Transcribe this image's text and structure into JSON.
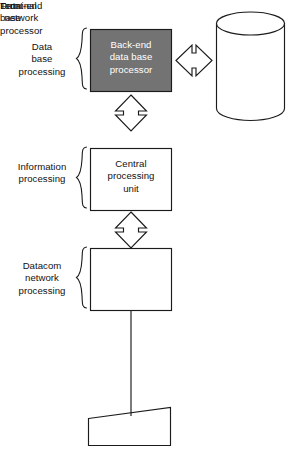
{
  "diagram": {
    "background_color": "#ffffff",
    "line_color": "#1b1b1b",
    "shaded_fill_color": "#737373",
    "shaded_text_color": "#ffffff",
    "group_labels": [
      {
        "id": "data-base-processing",
        "text": "Data\nbase\nprocessing"
      },
      {
        "id": "information-processing",
        "text": "Information\nprocessing"
      },
      {
        "id": "datacom-network-processing",
        "text": "Datacom\nnetwork\nprocessing"
      }
    ],
    "nodes": [
      {
        "id": "back-end-data-base-processor",
        "text": "Back-end\ndata base\nprocessor",
        "shape": "rectangle",
        "shaded": true
      },
      {
        "id": "data-base",
        "text": "Data\nbase",
        "shape": "cylinder",
        "shaded": false
      },
      {
        "id": "central-processing-unit",
        "text": "Central\nprocessing\nunit",
        "shape": "rectangle",
        "shaded": false
      },
      {
        "id": "front-end-network-processor",
        "text": "Front-end\nnetwork\nprocessor",
        "shape": "rectangle",
        "shaded": false
      },
      {
        "id": "terminal",
        "text": "Terminal",
        "shape": "trapezoid",
        "shaded": false
      }
    ],
    "connectors": [
      {
        "id": "backend-to-database",
        "from": "back-end-data-base-processor",
        "to": "data-base",
        "style": "double-headed-hollow-arrow",
        "orientation": "horizontal"
      },
      {
        "id": "cpu-to-backend",
        "from": "central-processing-unit",
        "to": "back-end-data-base-processor",
        "style": "double-headed-hollow-arrow",
        "orientation": "vertical"
      },
      {
        "id": "frontend-to-cpu",
        "from": "front-end-network-processor",
        "to": "central-processing-unit",
        "style": "double-headed-hollow-arrow",
        "orientation": "vertical"
      },
      {
        "id": "frontend-to-terminal",
        "from": "front-end-network-processor",
        "to": "terminal",
        "style": "plain-line",
        "orientation": "vertical"
      }
    ]
  }
}
